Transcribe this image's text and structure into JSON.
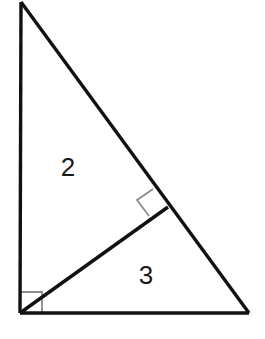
{
  "figure": {
    "background_color": "#ffffff",
    "stroke_color": "#111111",
    "marker_color": "#8c8c8c",
    "label_color": "#1a1a1a",
    "stroke_width": 3.4,
    "marker_stroke_width": 1.8,
    "canvas": {
      "width": 265,
      "height": 339
    }
  },
  "vertices": {
    "apex": {
      "name": "top-vertex",
      "x": 21,
      "y": 2
    },
    "right_angle": {
      "name": "bottom-left-vertex",
      "x": 20,
      "y": 313
    },
    "base_right": {
      "name": "bottom-right-vertex",
      "x": 249,
      "y": 313
    },
    "altitude_foot": {
      "name": "altitude-foot",
      "x": 168,
      "y": 207
    }
  },
  "segments": [
    {
      "name": "left-leg",
      "x1": 21,
      "y1": 2,
      "x2": 20,
      "y2": 313
    },
    {
      "name": "hypotenuse",
      "x1": 21,
      "y1": 2,
      "x2": 249,
      "y2": 313
    },
    {
      "name": "base",
      "x1": 20,
      "y1": 313,
      "x2": 249,
      "y2": 313
    },
    {
      "name": "altitude",
      "x1": 20,
      "y1": 313,
      "x2": 168,
      "y2": 207
    }
  ],
  "right_angle_markers": [
    {
      "name": "corner-right-angle-marker",
      "points": "42,313 42,292 20,292",
      "at_vertex": "bottom-left-vertex"
    },
    {
      "name": "altitude-right-angle-marker",
      "points": "153,189 137,200 149,216",
      "at_vertex": "altitude-foot"
    }
  ],
  "labels": {
    "upper_region": {
      "name": "label-2",
      "text": "2",
      "x": 68,
      "y": 169
    },
    "lower_region": {
      "name": "label-3",
      "text": "3",
      "x": 146,
      "y": 277
    }
  }
}
